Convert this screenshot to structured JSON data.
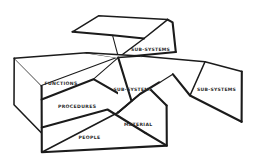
{
  "figure": {
    "background_color": "#ffffff",
    "ink_color": "#1b1b1b",
    "style": "hand-drawn sketch"
  },
  "labels": {
    "functions": "FUNCTIONS",
    "procedures": "PROCEDURES",
    "people": "PEOPLE",
    "material": "MATERIAL",
    "subsystem_center": "SUB-SYSTEMS",
    "subsystem_top": "SUB-SYSTEMS",
    "subsystem_right": "SUB-SYSTEMS"
  },
  "parts": {
    "main_box": "main-system-box",
    "box_left_face": "box-left-face",
    "box_top_face": "box-top-face",
    "box_front_face": "box-front-face",
    "panel_top": "detached-subsystem-panel-top",
    "panel_center": "detached-subsystem-panel-center",
    "panel_right": "detached-subsystem-panel-right"
  }
}
